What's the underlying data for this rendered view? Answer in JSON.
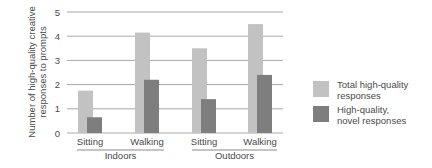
{
  "chart_data": {
    "type": "bar",
    "title": "",
    "ylabel": "Number of high-quality creative responses to prompts",
    "ylabel_lines": [
      "Number of high-quality creative",
      "responses to prompts"
    ],
    "xlabel": "",
    "ylim": [
      0,
      5
    ],
    "yticks": [
      0,
      1,
      2,
      3,
      4,
      5
    ],
    "grid": true,
    "categories": [
      "Sitting",
      "Walking",
      "Sitting",
      "Walking"
    ],
    "groups": [
      {
        "label": "Indoors",
        "categories": [
          "Sitting",
          "Walking"
        ]
      },
      {
        "label": "Outdoors",
        "categories": [
          "Sitting",
          "Walking"
        ]
      }
    ],
    "series": [
      {
        "name": "Total high-quality responses",
        "legend_lines": [
          "Total high-quality",
          "responses"
        ],
        "color": "#c2c2c2",
        "values": [
          1.75,
          4.15,
          3.5,
          4.5
        ]
      },
      {
        "name": "High-quality, novel responses",
        "legend_lines": [
          "High-quality,",
          "novel responses"
        ],
        "color": "#7e7e7e",
        "values": [
          0.65,
          2.2,
          1.4,
          2.4
        ]
      }
    ],
    "legend_position": "right"
  }
}
